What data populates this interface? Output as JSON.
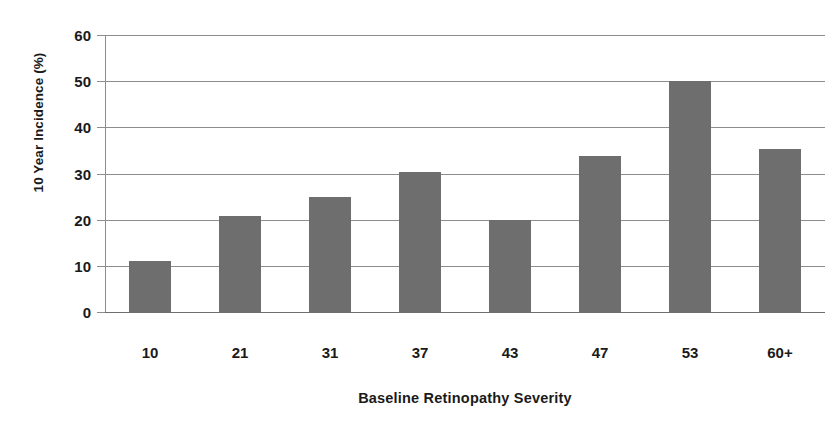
{
  "chart_data": {
    "type": "bar",
    "title": "",
    "title_note": "title row is cropped off the top edge of the screenshot",
    "xlabel": "Baseline Retinopathy Severity",
    "ylabel": "10 Year Incidence (%)",
    "categories": [
      "10",
      "21",
      "31",
      "37",
      "43",
      "47",
      "53",
      "60+"
    ],
    "values": [
      11,
      20.7,
      25,
      30.3,
      20,
      33.7,
      50,
      35.3
    ],
    "ylim": [
      0,
      60
    ],
    "ytick_labels": [
      "60",
      "50",
      "40",
      "30",
      "20",
      "10",
      "0"
    ],
    "ytick_values": [
      60,
      50,
      40,
      30,
      20,
      10,
      0
    ],
    "grid": "horizontal",
    "legend": "none",
    "series": [
      {
        "name": "10 Year Incidence (%)",
        "values": [
          11,
          20.7,
          25,
          30.3,
          20,
          33.7,
          50,
          35.3
        ]
      }
    ],
    "colors": {
      "bar_fill": "#6e6e6e",
      "gridline": "#8d8d8d",
      "axis": "#8d8d8d",
      "text": "#1a1a1a",
      "background": "#ffffff"
    }
  }
}
